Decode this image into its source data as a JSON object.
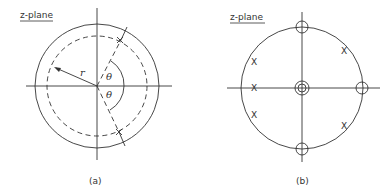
{
  "panel_a": {
    "plane_label": "z-plane",
    "radius_label": "r",
    "angle_label_upper": "θ",
    "angle_label_lower": "θ",
    "caption": "(a)",
    "marker": "x"
  },
  "panel_b": {
    "plane_label": "z-plane",
    "caption": "(b)",
    "pole_marker": "X",
    "poles": [
      "X",
      "X",
      "X",
      "X",
      "X"
    ]
  },
  "colors": {
    "stroke": "#333333",
    "background": "#ffffff"
  }
}
